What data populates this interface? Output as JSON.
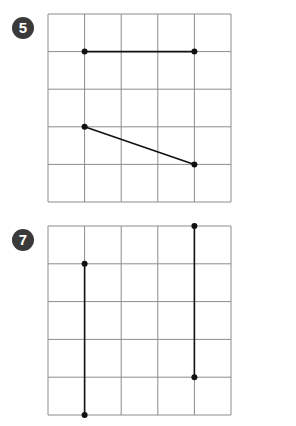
{
  "problems": [
    {
      "number": "5",
      "grid": {
        "cols": 5,
        "rows": 5,
        "x": 48,
        "y": 14,
        "cell_w": 36.6,
        "cell_h": 37.6
      },
      "segments": [
        {
          "from": [
            1,
            1
          ],
          "to": [
            4,
            1
          ]
        },
        {
          "from": [
            1,
            3
          ],
          "to": [
            4,
            4
          ]
        }
      ]
    },
    {
      "number": "7",
      "grid": {
        "cols": 5,
        "rows": 5,
        "x": 48,
        "y": 226,
        "cell_w": 36.6,
        "cell_h": 37.8
      },
      "segments": [
        {
          "from": [
            1,
            1
          ],
          "to": [
            1,
            5
          ]
        },
        {
          "from": [
            4,
            0
          ],
          "to": [
            4,
            4
          ]
        }
      ]
    }
  ],
  "colors": {
    "grid": "#8c8c8c",
    "line": "#111111",
    "badge": "#3a3a3a"
  }
}
